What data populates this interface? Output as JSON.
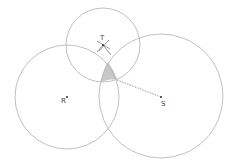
{
  "diagram": {
    "type": "three intersecting circles",
    "colors": {
      "circle_stroke": "#b0b0b0",
      "shade_fill": "#c8c8c8",
      "point": "#333333",
      "dashed_line": "#555555"
    },
    "circles": [
      {
        "name": "R",
        "cx": 67,
        "cy": 97,
        "r": 52
      },
      {
        "name": "S",
        "cx": 161,
        "cy": 96,
        "r": 62
      },
      {
        "name": "T",
        "cx": 103,
        "cy": 45,
        "r": 37
      }
    ],
    "points": [
      {
        "label": "R",
        "x": 67,
        "y": 97
      },
      {
        "label": "S",
        "x": 161,
        "y": 97
      },
      {
        "label": "T",
        "x": 103,
        "y": 45
      }
    ],
    "labels": {
      "r": "R",
      "s": "S",
      "t": "T"
    },
    "shaded_region": "intersection of circles R, S and T",
    "dashed_segment": {
      "from": [
        117,
        80
      ],
      "to": [
        161,
        97
      ]
    }
  }
}
